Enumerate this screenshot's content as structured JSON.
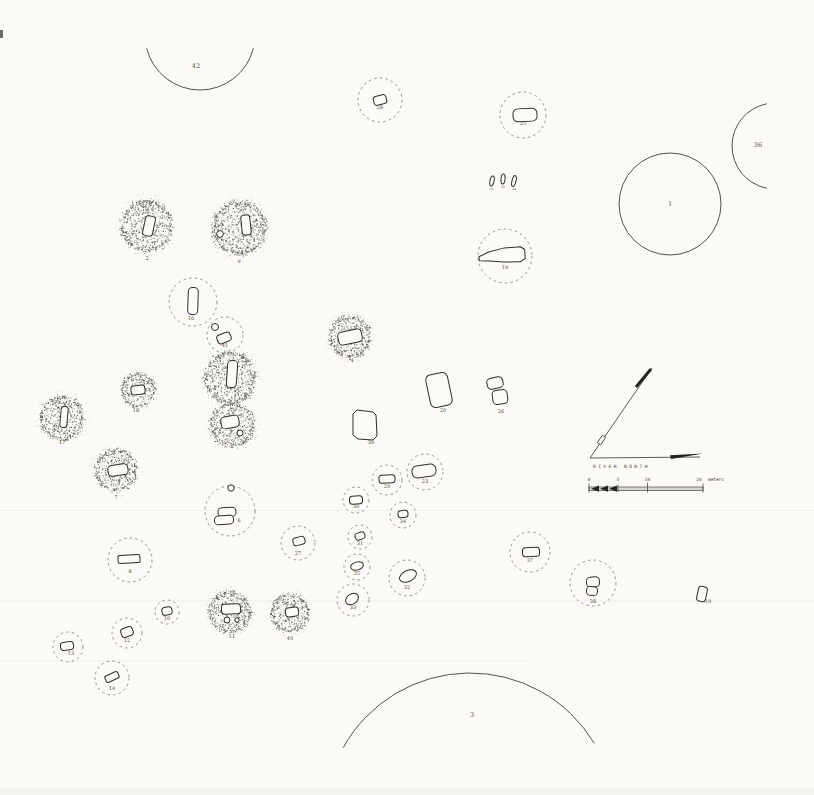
{
  "map": {
    "background": "#fbfaf6",
    "ink": "#54524b",
    "dash_color": "#8b897f",
    "north_arrow": {
      "label": "RIVER NORTH"
    },
    "scale_bar": {
      "labels": [
        "0",
        "5",
        "10",
        "20"
      ],
      "unit": "meters"
    },
    "features": [
      {
        "label": "42",
        "type": "arc",
        "cx": 200,
        "cy": 35,
        "r": 55,
        "a0": 166,
        "a1": 14,
        "sweep": 0,
        "ldx": -4,
        "ldy": 33
      },
      {
        "label": "28",
        "type": "dashed",
        "cx": 380,
        "cy": 100,
        "r": 22,
        "ldy": 9,
        "pits": [
          {
            "k": "rrect",
            "x": 0,
            "y": 0,
            "w": 13,
            "h": 9,
            "rot": -15,
            "rx": 3
          }
        ]
      },
      {
        "label": "25",
        "type": "dashed",
        "cx": 523,
        "cy": 115,
        "r": 23,
        "ldy": 10,
        "pits": [
          {
            "k": "rrect",
            "x": 2,
            "y": 0,
            "w": 24,
            "h": 13,
            "rot": -3,
            "rx": 5
          }
        ]
      },
      {
        "label": "36",
        "type": "arc",
        "cx": 775,
        "cy": 146,
        "r": 43,
        "a0": 259,
        "a1": 101,
        "sweep": 0,
        "ldx": -17,
        "ldy": 1
      },
      {
        "label": "1",
        "type": "circle",
        "cx": 670,
        "cy": 204,
        "r": 51,
        "ldy": 2
      },
      {
        "label": "21",
        "type": "shape",
        "cx": 492,
        "cy": 181,
        "small": true,
        "ldy": 9,
        "pits": [
          {
            "k": "oval",
            "x": 0,
            "y": 0,
            "rx": 2,
            "ry": 5,
            "rot": 12
          }
        ]
      },
      {
        "label": "22",
        "type": "shape",
        "cx": 503,
        "cy": 179,
        "small": true,
        "ldy": 9,
        "pits": [
          {
            "k": "oval",
            "x": 0,
            "y": 0,
            "rx": 2,
            "ry": 5,
            "rot": 5
          }
        ]
      },
      {
        "label": "24",
        "type": "shape",
        "cx": 514,
        "cy": 181,
        "small": true,
        "ldy": 9,
        "pits": [
          {
            "k": "oval",
            "x": 0,
            "y": 0,
            "rx": 2,
            "ry": 5.5,
            "rot": 14
          }
        ]
      },
      {
        "label": "2",
        "type": "mound",
        "cx": 147,
        "cy": 226,
        "r": 26,
        "pits": [
          {
            "k": "rrect",
            "x": 2,
            "y": 0,
            "w": 10,
            "h": 20,
            "rot": 12,
            "rx": 3
          }
        ]
      },
      {
        "label": "9",
        "type": "mound",
        "cx": 239,
        "cy": 228,
        "r": 27,
        "pits": [
          {
            "k": "rrect",
            "x": 7,
            "y": -3,
            "w": 9,
            "h": 20,
            "rot": -6,
            "rx": 3
          },
          {
            "k": "circle",
            "x": -19,
            "y": 6,
            "r": 3.4
          }
        ]
      },
      {
        "label": "19",
        "type": "dashed",
        "cx": 505,
        "cy": 256,
        "r": 27,
        "ldy": 13,
        "pits": [
          {
            "k": "poly",
            "x": -2,
            "y": 0,
            "rot": -4,
            "pts": [
              [
                -24,
                -1
              ],
              [
                -14,
                -5
              ],
              [
                2,
                -8
              ],
              [
                18,
                -8
              ],
              [
                22,
                -5
              ],
              [
                22,
                4
              ],
              [
                17,
                7
              ],
              [
                0,
                6
              ],
              [
                -14,
                4
              ],
              [
                -24,
                3
              ]
            ]
          }
        ]
      },
      {
        "label": "16",
        "type": "dashed",
        "cx": 193,
        "cy": 302,
        "r": 24,
        "ldx": -2,
        "ldy": 18,
        "pits": [
          {
            "k": "rrect",
            "x": 0,
            "y": -1,
            "w": 10,
            "h": 27,
            "rot": 2,
            "rx": 4
          }
        ]
      },
      {
        "label": "41",
        "type": "dashed",
        "cx": 225,
        "cy": 335,
        "r": 18,
        "ldy": 12,
        "pits": [
          {
            "k": "circle",
            "x": -10,
            "y": -8,
            "r": 3.5
          },
          {
            "k": "rrect",
            "x": -1,
            "y": 3,
            "w": 14,
            "h": 9,
            "rot": -22,
            "rx": 3
          }
        ]
      },
      {
        "label": "4",
        "type": "mound",
        "cx": 350,
        "cy": 337,
        "r": 21,
        "ldx": 2,
        "ldy": 25,
        "pits": [
          {
            "k": "rrect",
            "x": 0,
            "y": 0,
            "w": 24,
            "h": 13,
            "rot": -12,
            "rx": 4
          }
        ]
      },
      {
        "label": "15",
        "type": "mound",
        "cx": 230,
        "cy": 378,
        "r": 26,
        "ldx": 18,
        "ldy": 21,
        "pits": [
          {
            "k": "rrect",
            "x": 2,
            "y": -4,
            "w": 10,
            "h": 27,
            "rot": 4,
            "rx": 4
          }
        ]
      },
      {
        "label": "18",
        "type": "mound",
        "cx": 138,
        "cy": 390,
        "r": 17,
        "ldx": -2,
        "ldy": 22,
        "pits": [
          {
            "k": "rrect",
            "x": 0,
            "y": 0,
            "w": 14,
            "h": 9,
            "rot": -6,
            "rx": 3
          }
        ]
      },
      {
        "label": "20",
        "type": "shape",
        "cx": 439,
        "cy": 390,
        "ldx": 4,
        "ldy": 22,
        "pits": [
          {
            "k": "rrect",
            "x": 0,
            "y": 0,
            "w": 22,
            "h": 33,
            "rot": -12,
            "rx": 5
          }
        ]
      },
      {
        "label": "26",
        "type": "shape",
        "cx": 497,
        "cy": 390,
        "ldx": 4,
        "ldy": 23,
        "pits": [
          {
            "k": "rrect",
            "x": -2,
            "y": -7,
            "w": 16,
            "h": 11,
            "rot": -12,
            "rx": 4
          },
          {
            "k": "rrect",
            "x": 3,
            "y": 7,
            "w": 15,
            "h": 14,
            "rot": -8,
            "rx": 4
          }
        ]
      },
      {
        "label": "17",
        "type": "mound",
        "cx": 62,
        "cy": 418,
        "r": 22,
        "ldy": 26,
        "pits": [
          {
            "k": "rrect",
            "x": 2,
            "y": -1,
            "w": 7,
            "h": 21,
            "rot": 5,
            "rx": 3
          }
        ]
      },
      {
        "label": "5",
        "type": "mound",
        "cx": 232,
        "cy": 425,
        "r": 22,
        "ldy": 23,
        "pits": [
          {
            "k": "rrect",
            "x": -2,
            "y": -3,
            "w": 18,
            "h": 12,
            "rot": -10,
            "rx": 4
          },
          {
            "k": "circle",
            "x": 8,
            "y": 8,
            "r": 3
          }
        ]
      },
      {
        "label": "39",
        "type": "shape",
        "cx": 365,
        "cy": 425,
        "ldx": 6,
        "ldy": 19,
        "pits": [
          {
            "k": "poly",
            "x": 0,
            "y": 0,
            "rot": 0,
            "pts": [
              [
                -8,
                -15
              ],
              [
                8,
                -13
              ],
              [
                11,
                -10
              ],
              [
                12,
                11
              ],
              [
                8,
                15
              ],
              [
                -7,
                14
              ],
              [
                -12,
                10
              ],
              [
                -12,
                -11
              ]
            ]
          }
        ]
      },
      {
        "label": "7",
        "type": "mound",
        "cx": 116,
        "cy": 470,
        "r": 21,
        "pits": [
          {
            "k": "rrect",
            "x": 2,
            "y": 0,
            "w": 20,
            "h": 11,
            "rot": -8,
            "rx": 4
          }
        ]
      },
      {
        "label": "23",
        "type": "dashed",
        "cx": 425,
        "cy": 472,
        "r": 18,
        "ldy": 11,
        "pits": [
          {
            "k": "rrect",
            "x": -1,
            "y": -1,
            "w": 24,
            "h": 12,
            "rot": -8,
            "rx": 5
          }
        ]
      },
      {
        "label": "29",
        "type": "dashed",
        "cx": 387,
        "cy": 480,
        "r": 15,
        "ldy": 8,
        "pits": [
          {
            "k": "rrect",
            "x": 0,
            "y": -1,
            "w": 16,
            "h": 8,
            "rot": -3,
            "rx": 3
          }
        ]
      },
      {
        "label": "30",
        "type": "dashed",
        "cx": 356,
        "cy": 500,
        "r": 13,
        "ldy": 8,
        "pits": [
          {
            "k": "rrect",
            "x": 0,
            "y": 0,
            "w": 13,
            "h": 8,
            "rot": -5,
            "rx": 3
          }
        ]
      },
      {
        "label": "6",
        "type": "dashed",
        "cx": 230,
        "cy": 511,
        "r": 25,
        "ldx": 9,
        "ldy": 11,
        "pits": [
          {
            "k": "circle",
            "x": 1,
            "y": -23,
            "r": 3.2
          },
          {
            "k": "rrect",
            "x": -3,
            "y": 1,
            "w": 18,
            "h": 9,
            "rot": -3,
            "rx": 4
          },
          {
            "k": "rrect",
            "x": -6,
            "y": 9,
            "w": 19,
            "h": 9,
            "rot": -4,
            "rx": 4
          }
        ]
      },
      {
        "label": "34",
        "type": "dashed",
        "cx": 403,
        "cy": 515,
        "r": 13,
        "ldy": 8,
        "pits": [
          {
            "k": "rrect",
            "x": 0,
            "y": -1,
            "w": 10,
            "h": 7,
            "rot": -5,
            "rx": 3
          }
        ]
      },
      {
        "label": "31",
        "type": "dashed",
        "cx": 360,
        "cy": 537,
        "r": 12,
        "ldy": 8,
        "pits": [
          {
            "k": "rrect",
            "x": 0,
            "y": -1,
            "w": 10,
            "h": 7,
            "rot": -20,
            "rx": 3
          }
        ]
      },
      {
        "label": "27",
        "type": "dashed",
        "cx": 298,
        "cy": 543,
        "r": 17,
        "ldy": 12,
        "pits": [
          {
            "k": "rrect",
            "x": 1,
            "y": -2,
            "w": 12,
            "h": 8,
            "rot": -15,
            "rx": 3
          }
        ]
      },
      {
        "label": "37",
        "type": "dashed",
        "cx": 530,
        "cy": 552,
        "r": 20,
        "ldy": 10,
        "pits": [
          {
            "k": "rrect",
            "x": 1,
            "y": 0,
            "w": 17,
            "h": 9,
            "rot": -2,
            "rx": 3
          }
        ]
      },
      {
        "label": "8",
        "type": "dashed",
        "cx": 130,
        "cy": 560,
        "r": 22,
        "ldy": 13,
        "pits": [
          {
            "k": "rrect",
            "x": -1,
            "y": -1,
            "w": 22,
            "h": 8,
            "rot": -3,
            "rx": 2
          }
        ]
      },
      {
        "label": "35",
        "type": "dashed",
        "cx": 357,
        "cy": 567,
        "r": 13,
        "ldy": 8,
        "pits": [
          {
            "k": "oval",
            "x": 0,
            "y": -1,
            "rx": 6.5,
            "ry": 4,
            "rot": -15
          }
        ]
      },
      {
        "label": "32",
        "type": "dashed",
        "cx": 407,
        "cy": 578,
        "r": 18,
        "ldy": 11,
        "pits": [
          {
            "k": "oval",
            "x": 1,
            "y": -2,
            "rx": 9,
            "ry": 5.5,
            "rot": -25
          }
        ]
      },
      {
        "label": "19",
        "type": "shape",
        "cx": 702,
        "cy": 594,
        "ldx": 6,
        "ldy": 9,
        "pits": [
          {
            "k": "rrect",
            "x": 0,
            "y": 0,
            "w": 9,
            "h": 15,
            "rot": 12,
            "rx": 3
          }
        ]
      },
      {
        "label": "33",
        "type": "dashed",
        "cx": 353,
        "cy": 600,
        "r": 16,
        "ldy": 9,
        "pits": [
          {
            "k": "oval",
            "x": -1,
            "y": -1,
            "rx": 7,
            "ry": 5,
            "rot": -35
          }
        ]
      },
      {
        "label": "38",
        "type": "dashed",
        "cx": 593,
        "cy": 583,
        "r": 23,
        "ldy": 20,
        "pits": [
          {
            "k": "rrect",
            "x": 0,
            "y": -1,
            "w": 13,
            "h": 10,
            "rot": -5,
            "rx": 4
          },
          {
            "k": "rrect",
            "x": -1,
            "y": 8,
            "w": 11,
            "h": 9,
            "rot": 5,
            "rx": 4
          }
        ]
      },
      {
        "label": "10",
        "type": "dashed",
        "cx": 167,
        "cy": 612,
        "r": 12,
        "ldy": 8,
        "pits": [
          {
            "k": "rrect",
            "x": 0,
            "y": -1,
            "w": 10,
            "h": 8,
            "rot": -10,
            "rx": 3
          }
        ]
      },
      {
        "label": "11",
        "type": "mound",
        "cx": 230,
        "cy": 612,
        "r": 21,
        "ldx": 2,
        "ldy": 26,
        "pits": [
          {
            "k": "rrect",
            "x": 1,
            "y": -3,
            "w": 19,
            "h": 10,
            "rot": -3,
            "rx": 3
          },
          {
            "k": "circle",
            "x": -3,
            "y": 8,
            "r": 3
          },
          {
            "k": "circle",
            "x": 7,
            "y": 8,
            "r": 2.2
          }
        ]
      },
      {
        "label": "40",
        "type": "mound",
        "cx": 290,
        "cy": 613,
        "r": 19,
        "pits": [
          {
            "k": "rrect",
            "x": 2,
            "y": -1,
            "w": 13,
            "h": 9,
            "rot": -8,
            "rx": 3
          }
        ]
      },
      {
        "label": "12",
        "type": "dashed",
        "cx": 127,
        "cy": 633,
        "r": 15,
        "ldy": 9,
        "pits": [
          {
            "k": "rrect",
            "x": 0,
            "y": -1,
            "w": 12,
            "h": 9,
            "rot": -20,
            "rx": 3
          }
        ]
      },
      {
        "label": "13",
        "type": "dashed",
        "cx": 68,
        "cy": 647,
        "r": 15,
        "ldx": 3,
        "ldy": 8,
        "pits": [
          {
            "k": "rrect",
            "x": -1,
            "y": -1,
            "w": 13,
            "h": 8,
            "rot": -8,
            "rx": 3
          }
        ]
      },
      {
        "label": "14",
        "type": "dashed",
        "cx": 112,
        "cy": 678,
        "r": 17,
        "ldy": 12,
        "pits": [
          {
            "k": "rrect",
            "x": 0,
            "y": -1,
            "w": 14,
            "h": 7,
            "rot": -25,
            "rx": 2
          }
        ]
      },
      {
        "label": "3",
        "type": "arc",
        "cx": 470,
        "cy": 818,
        "r": 145,
        "a0": 209,
        "a1": 329,
        "sweep": 1,
        "ldx": 2,
        "ldy": -101
      }
    ]
  }
}
